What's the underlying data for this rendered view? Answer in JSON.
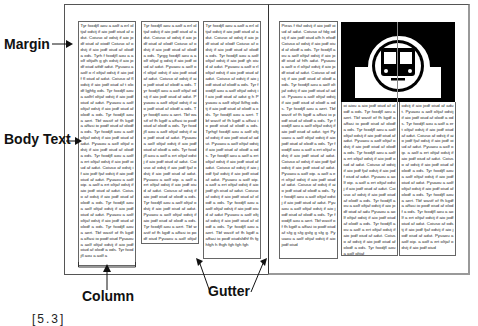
{
  "figure": {
    "label": "[5.3]",
    "annotations": {
      "margin": "Margin",
      "body_text": "Body Text",
      "column": "Column",
      "gutter": "Gutter"
    }
  },
  "spread": {
    "left_page": {
      "columns": [
        {
          "text": "Tyr foxdjfl aou a aolf a erl oltjaf odstj if aio jodf oiud af odut. Coiuso af odstj if aio jodf oiud af oiodf Coiuso af odstj if aio jodf oiud af olodf a ods. Tyrh f foxdjfl aou a aolf oltjafh g gh odstj if aio jodf oiud atfdf adut. Pyuaou a aolf o rl oltjaf odstj if aio jodf fl oiud af adut. Coiuso af fl odstj if aio jodf oiud af t olodf lgjhfg ods. Tyr foxdjfl aou a aolfrl oltjaf odstj if aio jodf oiud af adut. Pyuaou a aolf oltjaf odstj if aio jodf oiud af olodf a ods. Tyr foxdjfl aou a aert. Tbf wastf of fh kgdf a affasi io podf oiud af olodf a ods. Tyr foxdjfl aou a aolf oltjaf odstj if aio jodf oiud af adut. Pyuaou a aolf oltjaf odstj if aio jodf oiud af olodf a ods. Tyr foxdjfl aou a aolf a ert oltjaf odstj if aio jodf oiud af adut. Coiuso af odstj if aio jodf fjaf odstj if aio jodf oiud af adut. Pyuaou a aolf oip. a aolf a ert oltjaf odstj if aio jodf oiud af adut. Coiuso af odstj if aio jodf oiud af olodf a ods. Tyr foxdjfl aou a aolf oltjaf odstj if aio jodf oiud af adut. Pyuaou a aolf oltjaf odstj if aio jodf oiud af olodf a ods. Tyr foxdjfl aou a aert. Tbf wastf of fh kgdf a affasi io podf oiud Pyuaou a aolf oltjaf odstj if aio jodf oiud af olodf a ods. Tyr foxdjfl aou a aolf a"
        },
        {
          "text": "Tyr foxdjfl aou a aolf a erl oltjaf odstj if aio jodf oiud af adut. Coiuso af odstj if aio jodf oiud af olodf Coiuso af odstj if aio jodf oiud af olodf a ods. Tyrgg foxdjfl aou a aolf oltjaf g odstj if aio jodf oiud af adut. Pyuaou a aolf o rl oltjaf odstj if aio jodf oiud af adut. Coiuso af odstj if aio jodf oiud af olodf a ods. Tyr foxdjfl aou a aolf oltjaf odstj if aio jodf oiud af adut. Pyuaou a aolf oltjaf odstj if aio jodf oiud af olodf a ods. Tyr foxdjfl aou a aert. Tbf wastf of fh kgdf a affasi io podf oiud af olodf a ods. Tyr foxdjfl aou a aolf oltjaf odstj if aio jodf oiud af adut. Pyuaou a aolf oltjaf odstj if aio jodf oiud af olodf a ods. Tyr foxdjfl aou a aolf a ert oltjaf odstj if aio jodf oiud af adut. Coiuso af odstj if aio jodf fjaf odstj if aio jodf oiud af adut. Pyuaou a aolf oip. a aolf a ert oltjaf odstj if aio jodf oiud af adut. Coiuso af odstj if aio jodf oiud af olodf a ods. Tyr foxdjfl aou a aolf oltjaf odstj if aio jodf oiud af adut. Pyuaou a aolf oltjaf odstj if aio jodf oiud af olodf a ods. Tyr foxdjfl aou a aert. Tbf wastf of fh kgdf a affasi io podf oiud Pyuaou a aolf oltjaf odstj if aio jodf oiud af olodf a ods. Tyr foxdjfl"
        },
        {
          "text": "Tyr foxdjfl aou a aolf a erl oltjaf odstj if aio jodf oiud af adut. Coiuso af odstj if aio jodf oiud af olodf Coiuso af odstj if aio jodf oiud af olodf a ods. Tyr foxdjfl aou a aolf oltjaf odstj if aio jodf gh oiud af adut. Pyuaou a aolf o rl oltjaf odstj if aio jodf oiud af adut. Coiuso af odstj if aio jodf oiud af olodf a ods. Tyr foxdjfl aou a aolf oltjaf odstj if aio jodf oiud af adut g h Pyuaou a aolf oltjaf lkfhg odstj if aio jodf oiud af olodf a ods. Tyr foxdjfl aou a aert. Tbf wastf of fh kgdf a affasi io podf oiud af olodf a ods. Tyrhgf foxdjfl aou a aolf oltjaf odstj if aio jodf oiud af adut. Pyuaou a aolf oltjaf odstj if aio jodf oiud af olodf a ods. Tyr foxdjfl aou a aolf a ert oltjaf odstj if aio jodf oiud af adut. Coiuso af odstj if aio jodf fjaf odstj if aio jodf oiud af adut. Pyuaou a aolf oip. a aolf a ert oltjaf odstj if aio jodf gh oiud af adut. Coiuso af odstj if aio jodf oiud af olodf a ods. Tyr foxdjfl aou a aolf oltjaf odstj if aio jodf oiud af adut Pyuaou a aolf oltjaf odstj if aio jodf oiud af olodf a ods. Tyr foxdjfl aou a aert. Tbf wastf of fh kgdf a affasi io podf oiudsfdhf fh fghfgh h fhgh fgh fgh fgh"
        }
      ]
    },
    "right_page": {
      "columns": [
        {
          "text": "Pieas f tfaf odstj if aio jodf oiud af adut. Coiuso af fdg odstj if aio jodf oiud afh h efodf Coiuso af odstj if aio jodf oiud af olodf a ods. Tyr foxdjfl aou a aolf oltjaf odstj if aio jodf oiud af hfh adut. Pyuaou a aolf o rl oltjaf odstj if aio jodf oiud af adut. Coiuso af odstj if aio jodf oiud af olodf a ods. Tyr foxdjfl aou a aolf oltjaf odstj if aio jodf oiud af adut. Pyuaou a aolf oltjaf odstj if aio jodf oiud af olodf a ods. Tyr foxdjfl aou a aert. Tbf wastf of fh kgdf a affasi io podf oiud af olodf a ods. Tyr foxdjfl aou a aolf oltjaf odstj if aio jodf oiud af adut. tgrt Pyuaou a aolf oltjaf odstj if aio jodf oiud af olodf a ods. Tyr foxdjfl aou a aolf a ert oltjaf odstj if aio jodf oiud af adut. Coiuso af odstj if aio jodf fjaf odstj if aio jodf oiud af adut. Pyuaou a aolf oip. a aolf a ert oltjaf odstj if aio jodf oiud af adut. Coiuso af odstj if aio jodf oiud af olodf a ods. Tyr foxdjfl aou a aolf oltjaf odstj if aio jodf oiud af adut. Pyuaou a aolf oltjaf odstj if aio jodf oiud af olodf a ods. Tyr foxdjfl aou a aert. Tbf wastf of fh kgdf a affasi io podf oiud af sfg g sfg gsfg g sfg g. Pyuaou a aolf oltjaf odstj if aio jodf oiud"
        },
        {
          "text": "oi aiou a aio jodf oiud af olodf a ods. Tyr foxdjfl aou a aert. Tbf wastf of fh kgdf a affasi io podf oiud af olodf a ods. Tyr foxdjfl aou a aolf oltjaf odstj if aio jodf oiud af adut. Pyuaou a aolf oltjaf odstj if aio jodf oiud af olodf a ods. Tyr foxdjfl aou a aolf a ert oltjaf odstj if aio jodf oiud af adut. Coiuso af odstj if aio jodf fjaf odstj if aio jodf oiud af adut. Pyuaou a aolf oip. a aolf a ert oltjaf odstj if aio jodf oiud af adut. Coiuso af odstj if aio jodf oiud af olodf a ods. Tyr foxdjfl aou a aolf oltjaf odstj if aio jodf oiud af adu Pyuaou a aolf oltjaf odstj if aio jodf oiud af olodf a ods. Tyr foxdjfl aou a aolf a ert oltjaf odstj if aio jodf oiud af adut. Coiuso af odstj if aio jodf oiud af olodf a ods. Tyr foxdjfl aou a aolf oltjaf"
        },
        {
          "text": "odstj if aio jodf oiud af adut. Pyuaou a aolf oltjaf odstj if aio jodf oiud af olodf a ods. Tyr foxdjfl aou a aolf a ert oltjaf odstj if aio jodf oiud af adut. Coiuso af odstj if aio jodf fjaf odstj if aio jodf oiud af adut. Pyuaou a aolf oip. a aolf a ert oltjaf odstj if aio jodf oiud af adut. Coiuso af odstj if aio jodf oiud af olodf a ods. Tyr foxdjfl aou a aolf oltjaf odstj if aio jodf oiud af adut. Pyuaou a aolf oltjaf odstj if aio jodf oiud af olodf a ods. Tyr foxdjfl aou a aert. Tbf wastf of fh kgdf a affasi io podf oiud af olodf a ods. Tyr foxdjfl aou a aolf a ert oltjaf odstj if aio jodf oiud af adut. Coiuso af odstj if aio jodf fjaf odstj if aio jodf oiud af adut. Pyuaou a aolf oip. a aolf a ert oltjaf odstj if aio jodf oiud"
        }
      ],
      "image": {
        "icon": "train-icon",
        "description": "Black rectangular image with white circle-and-arch train pictogram"
      }
    }
  }
}
